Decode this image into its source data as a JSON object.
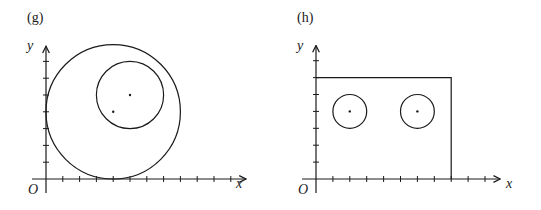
{
  "panels": [
    {
      "label": "(g)",
      "x_axis_label": "x",
      "y_axis_label": "y",
      "origin_label": "O",
      "origin_px": [
        46,
        179
      ],
      "unit_px": 16.8,
      "x_ticks": 11,
      "y_ticks": 7,
      "shapes": [
        {
          "type": "circle",
          "center": [
            4,
            4
          ],
          "radius": 4
        },
        {
          "type": "circle",
          "center": [
            5,
            5
          ],
          "radius": 2
        }
      ],
      "points": [
        [
          4,
          4
        ],
        [
          5,
          5
        ]
      ]
    },
    {
      "label": "(h)",
      "x_axis_label": "x",
      "y_axis_label": "y",
      "origin_label": "O",
      "origin_px": [
        316,
        179
      ],
      "unit_px": 16.9,
      "x_ticks": 10,
      "y_ticks": 7,
      "shapes": [
        {
          "type": "rectangle",
          "x": [
            0,
            8
          ],
          "y": [
            0,
            6
          ]
        },
        {
          "type": "circle",
          "center": [
            2,
            4
          ],
          "radius": 1
        },
        {
          "type": "circle",
          "center": [
            6,
            4
          ],
          "radius": 1
        }
      ],
      "points": [
        [
          2,
          4
        ],
        [
          6,
          4
        ]
      ]
    }
  ],
  "colors": {
    "stroke": "#1a1a1a",
    "background": "#ffffff"
  }
}
